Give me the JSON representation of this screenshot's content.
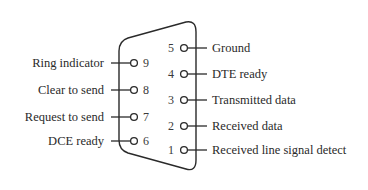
{
  "diagram": {
    "type": "connector-pinout",
    "connector_shape": "D-sub 9-pin (DE-9)",
    "stroke_color": "#2a2a2a",
    "background": "#ffffff",
    "left_pins": [
      {
        "number": "9",
        "label": "Ring indicator"
      },
      {
        "number": "8",
        "label": "Clear to send"
      },
      {
        "number": "7",
        "label": "Request to send"
      },
      {
        "number": "6",
        "label": "DCE ready"
      }
    ],
    "right_pins": [
      {
        "number": "5",
        "label": "Ground"
      },
      {
        "number": "4",
        "label": "DTE ready"
      },
      {
        "number": "3",
        "label": "Transmitted data"
      },
      {
        "number": "2",
        "label": "Received data"
      },
      {
        "number": "1",
        "label": "Received line signal detect"
      }
    ]
  }
}
